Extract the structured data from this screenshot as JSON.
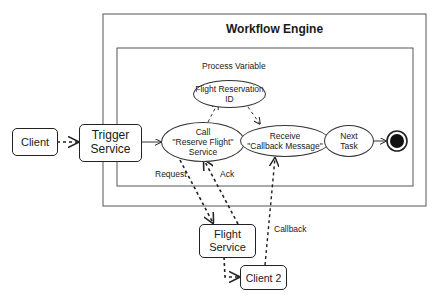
{
  "title": "Workflow Engine",
  "colors": {
    "stroke": "#222222",
    "frame": "#555555",
    "background": "#ffffff"
  },
  "nodes": {
    "client": "Client",
    "trigger": {
      "line1": "Trigger",
      "line2": "Service"
    },
    "call_service": {
      "line1": "Call",
      "line2": "\"Reserve Flight\"",
      "line3": "Service"
    },
    "process_variable_label": "Process Variable",
    "flight_reservation_id": {
      "line1": "Flight Reservation",
      "line2": "ID"
    },
    "receive": {
      "line1": "Receive",
      "line2": "\"Callback Message\""
    },
    "next_task": {
      "line1": "Next",
      "line2": "Task"
    },
    "flight_service": {
      "line1": "Flight",
      "line2": "Service"
    },
    "client2": "Client 2"
  },
  "edge_labels": {
    "request": "Request",
    "ack": "Ack",
    "callback": "Callback"
  }
}
